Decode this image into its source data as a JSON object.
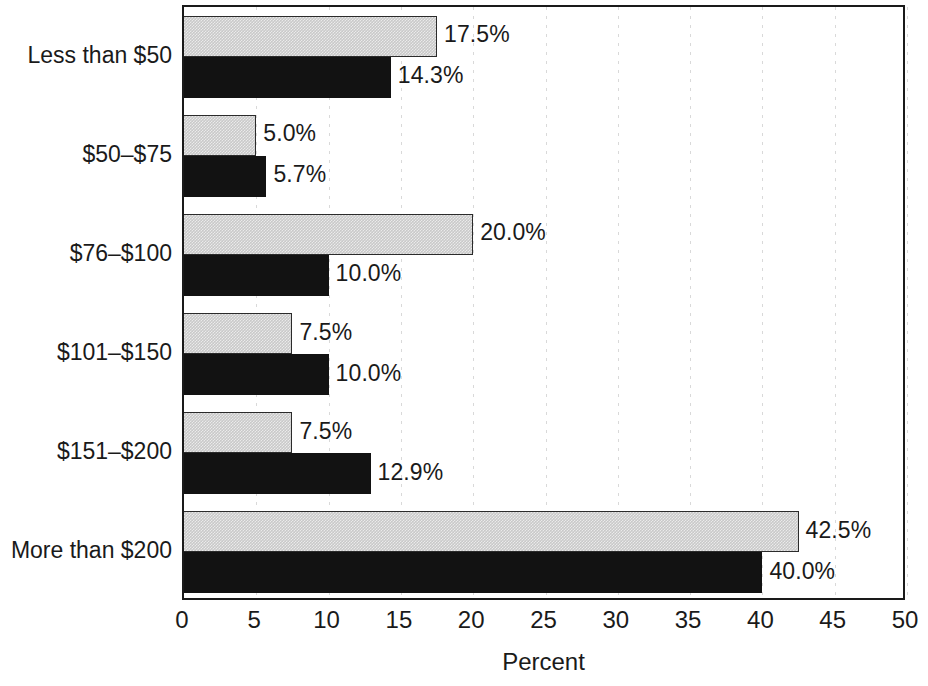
{
  "chart_data": {
    "type": "bar",
    "orientation": "horizontal",
    "title": "",
    "xlabel": "Percent",
    "ylabel": "",
    "xlim": [
      0,
      50
    ],
    "xticks": [
      0,
      5,
      10,
      15,
      20,
      25,
      30,
      35,
      40,
      45,
      50
    ],
    "xtick_labels": [
      "0",
      "5",
      "10",
      "15",
      "20",
      "25",
      "30",
      "35",
      "40",
      "45",
      "50"
    ],
    "grid": "vertical-dotted",
    "legend": "none",
    "categories": [
      "Less than $50",
      "$50–$75",
      "$76–$100",
      "$101–$150",
      "$151–$200",
      "More than $200"
    ],
    "series": [
      {
        "name": "series-light",
        "color": "#c9c9c9",
        "values": [
          17.5,
          5.0,
          20.0,
          7.5,
          7.5,
          42.5
        ],
        "labels": [
          "17.5%",
          "5.0%",
          "20.0%",
          "7.5%",
          "7.5%",
          "42.5%"
        ]
      },
      {
        "name": "series-dark",
        "color": "#121212",
        "values": [
          14.3,
          5.7,
          10.0,
          10.0,
          12.9,
          40.0
        ],
        "labels": [
          "14.3%",
          "5.7%",
          "10.0%",
          "10.0%",
          "12.9%",
          "40.0%"
        ]
      }
    ]
  },
  "colors": {
    "light_bar": "#c9c9c9",
    "dark_bar": "#121212",
    "axis": "#1a1a1a",
    "gridline": "#d9d9d9",
    "background": "#ffffff"
  }
}
